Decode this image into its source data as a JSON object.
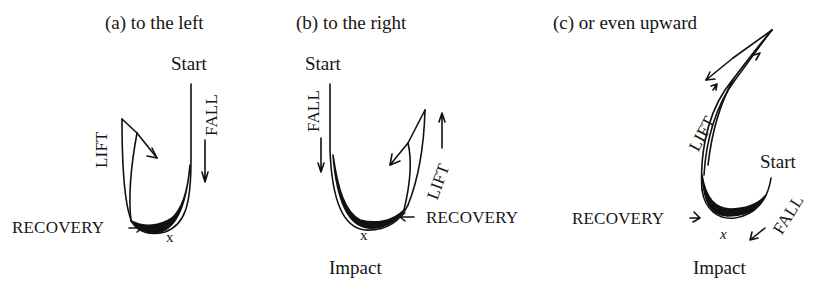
{
  "panels": [
    {
      "id": "a",
      "title": "(a) to the left",
      "start_label": "Start",
      "fall_label": "FALL",
      "lift_label": "LIFT",
      "recovery_label": "RECOVERY",
      "impact_marker": "x",
      "direction": "left"
    },
    {
      "id": "b",
      "title": "(b) to the right",
      "start_label": "Start",
      "fall_label": "FALL",
      "lift_label": "LIFT",
      "recovery_label": "RECOVERY",
      "impact_marker": "x",
      "impact_label": "Impact",
      "direction": "right"
    },
    {
      "id": "c",
      "title": "(c) or even upward",
      "start_label": "Start",
      "fall_label": "FALL",
      "lift_label": "LIFT",
      "recovery_label": "RECOVERY",
      "impact_marker": "x",
      "impact_label": "Impact",
      "direction": "upward"
    }
  ],
  "colors": {
    "ink": "#111111",
    "background": "#ffffff"
  }
}
